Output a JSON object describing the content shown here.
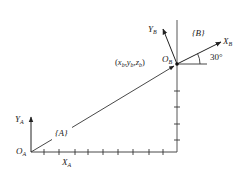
{
  "diagram": {
    "title": "",
    "frame_a": {
      "name": "{A}",
      "origin_label": "O",
      "origin_sub": "A",
      "x_axis_label": "X",
      "x_axis_sub": "A",
      "y_axis_label": "Y",
      "y_axis_sub": "A"
    },
    "frame_b": {
      "name": "{B}",
      "origin_label": "O",
      "origin_sub": "B",
      "x_axis_label": "X",
      "x_axis_sub": "B",
      "y_axis_label": "Y",
      "y_axis_sub": "B",
      "rotation_angle": "30°"
    },
    "position_vector": {
      "label_open": "(",
      "x": "x",
      "x_sub": "b",
      "y": "y",
      "y_sub": "b",
      "z": "z",
      "z_sub": "b",
      "label_close": ")",
      "separator": ","
    },
    "x_ticks": 9,
    "y_ticks": 4,
    "colors": {
      "stroke": "#333333",
      "text": "#222222",
      "background": "#ffffff"
    }
  }
}
